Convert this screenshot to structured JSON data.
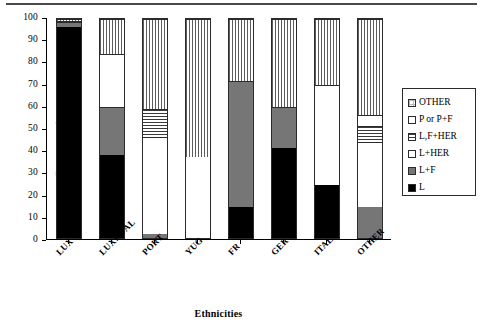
{
  "chart_data": {
    "type": "bar",
    "stacked": true,
    "title": "",
    "xlabel": "Ethnicities",
    "ylabel": "Percentage frequency",
    "ylim": [
      0,
      100
    ],
    "yticks": [
      0,
      10,
      20,
      30,
      40,
      50,
      60,
      70,
      80,
      90,
      100
    ],
    "grid": false,
    "legend_position": "right",
    "categories": [
      "LUX",
      "LUXDUAL",
      "PORT",
      "YUG",
      "FR",
      "GER",
      "ITAL",
      "OTHER"
    ],
    "series": [
      {
        "name": "L",
        "pattern": "solid-black",
        "color": "#000000",
        "values": [
          96.5,
          38.0,
          0.0,
          0.0,
          14.0,
          41.0,
          24.0,
          0.0
        ]
      },
      {
        "name": "L+F",
        "pattern": "solid-gray",
        "color": "#767676",
        "values": [
          2.0,
          22.0,
          2.0,
          0.0,
          57.5,
          19.0,
          0.0,
          14.0
        ]
      },
      {
        "name": "L+HER",
        "pattern": "white",
        "color": "#ffffff",
        "values": [
          0.0,
          24.0,
          44.0,
          37.0,
          0.0,
          0.0,
          46.0,
          30.0
        ]
      },
      {
        "name": "L,F+HER",
        "pattern": "horizontal-lines",
        "color": "#d2d2d2",
        "values": [
          0.5,
          0.0,
          13.0,
          0.0,
          0.0,
          0.0,
          0.0,
          7.0
        ]
      },
      {
        "name": "P or P+F",
        "pattern": "white",
        "color": "#ffffff",
        "values": [
          0.0,
          0.0,
          0.0,
          0.0,
          0.0,
          0.0,
          0.0,
          5.0
        ]
      },
      {
        "name": "OTHER",
        "pattern": "vertical-lines",
        "color": "#eaeaea",
        "values": [
          1.0,
          16.0,
          41.0,
          63.0,
          28.5,
          40.0,
          30.0,
          44.0
        ]
      }
    ]
  },
  "axes": {
    "y_label": "Percentage frequency",
    "x_label": "Ethnicities",
    "y_ticks": [
      "100",
      "90",
      "80",
      "70",
      "60",
      "50",
      "40",
      "30",
      "20",
      "10",
      "0"
    ],
    "x_ticks": [
      "LUX",
      "LUXDUAL",
      "PORT",
      "YUG",
      "FR",
      "GER",
      "ITAL",
      "OTHER"
    ]
  },
  "legend": {
    "items": [
      {
        "label": "OTHER",
        "swatch": "dotted-swatch"
      },
      {
        "label": "P or P+F",
        "swatch": "white-swatch"
      },
      {
        "label": "L,F+HER",
        "swatch": "horizontal-lines-swatch"
      },
      {
        "label": "L+HER",
        "swatch": "white-swatch"
      },
      {
        "label": "L+F",
        "swatch": "gray-swatch"
      },
      {
        "label": "L",
        "swatch": "black-swatch"
      }
    ]
  }
}
